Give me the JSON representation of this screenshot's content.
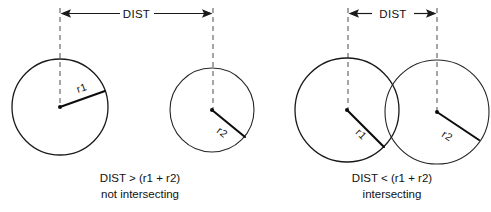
{
  "figure": {
    "background_color": "#ffffff",
    "line_color": "#1a1a1a",
    "dash_color": "#6b6b6b",
    "width": 491,
    "height": 212
  },
  "panels": [
    {
      "id": "non-intersecting",
      "dimension_label": "DIST",
      "caption_line1": "DIST > (r1 + r2)",
      "caption_line2": "not intersecting",
      "circles": [
        {
          "id": "left-circle",
          "radius_label": "r1",
          "cx": 60,
          "cy": 107,
          "r": 48
        },
        {
          "id": "right-circle",
          "radius_label": "r2",
          "cx": 212,
          "cy": 110,
          "r": 42
        }
      ]
    },
    {
      "id": "intersecting",
      "dimension_label": "DIST",
      "caption_line1": "DIST < (r1 + r2)",
      "caption_line2": "intersecting",
      "circles": [
        {
          "id": "left-circle",
          "radius_label": "r1",
          "cx": 347,
          "cy": 110,
          "r": 52
        },
        {
          "id": "right-circle",
          "radius_label": "r2",
          "cx": 437,
          "cy": 112,
          "r": 52
        }
      ]
    }
  ]
}
